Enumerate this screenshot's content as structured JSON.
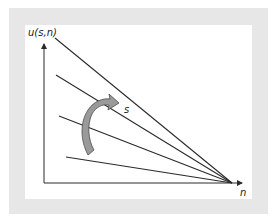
{
  "diagram": {
    "y_axis_label": "u(s,n)",
    "x_axis_label": "n",
    "arrow_label": "s",
    "colors": {
      "frame": "#e7e7e7",
      "panel": "#ffffff",
      "lines": "#2a2a2a",
      "arrow_fill": "#9a9a9a",
      "arrow_stroke": "#4a4a4a"
    },
    "convergence_point": [
      232,
      183
    ],
    "lines": [
      {
        "name": "line-1",
        "start": [
          55,
          38
        ]
      },
      {
        "name": "line-2",
        "start": [
          56,
          75
        ]
      },
      {
        "name": "line-3",
        "start": [
          59,
          116
        ]
      },
      {
        "name": "line-4",
        "start": [
          66,
          157
        ]
      }
    ]
  }
}
